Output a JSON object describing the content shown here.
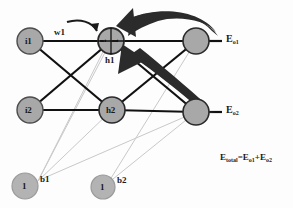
{
  "diagram": {
    "background_color": "#fdfdfd",
    "node_fill": "#a8a8a8",
    "node_stroke": "#4d4d4d",
    "edge_color": "#111111",
    "bias_edge_color": "#c9c9c9",
    "arrow_color": "#2b2b2b"
  },
  "nodes": {
    "input1": {
      "label": "i1"
    },
    "input2": {
      "label": "i2"
    },
    "hidden1": {
      "label": "h1",
      "inner_net": "net",
      "inner_out": "out"
    },
    "hidden2": {
      "label": "h2"
    },
    "output1": {
      "label": ""
    },
    "output2": {
      "label": ""
    },
    "bias1": {
      "inner": "1",
      "label": "b1"
    },
    "bias2": {
      "inner": "1",
      "label": "b2"
    }
  },
  "weights": {
    "w1": "w1"
  },
  "errors": {
    "e_o1_base": "E",
    "e_o1_sub": "o1",
    "e_o2_base": "E",
    "e_o2_sub": "o2"
  },
  "formula": {
    "lhs_base": "E",
    "lhs_sub": "total",
    "eq": "=",
    "t1_base": "E",
    "t1_sub": "o1",
    "plus": "+",
    "t2_base": "E",
    "t2_sub": "o2"
  }
}
